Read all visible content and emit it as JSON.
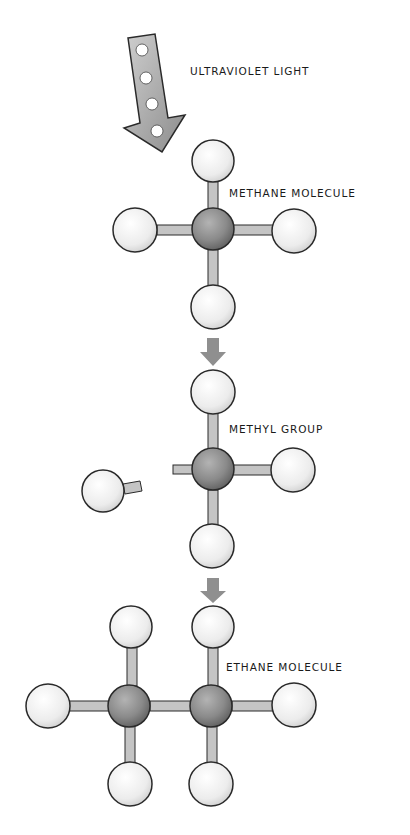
{
  "diagram": {
    "labels": {
      "light": "ULTRAVIOLET LIGHT",
      "methane": "METHANE MOLECULE",
      "methyl": "METHYL GROUP",
      "ethane": "ETHANE MOLECULE"
    },
    "colors": {
      "carbon": "#8a8a8a",
      "hydrogen": "#ececec",
      "bond": "#c4c4c4",
      "arrow": "#8f8f8f",
      "uv_arrow": "#b5b5b5",
      "outline": "#2a2a2a"
    },
    "stages": [
      {
        "name": "methane",
        "carbons": 1,
        "hydrogens": 4
      },
      {
        "name": "methyl",
        "carbons": 1,
        "hydrogens": 3,
        "detached_hydrogens": 1
      },
      {
        "name": "ethane",
        "carbons": 2,
        "hydrogens": 6
      }
    ]
  }
}
